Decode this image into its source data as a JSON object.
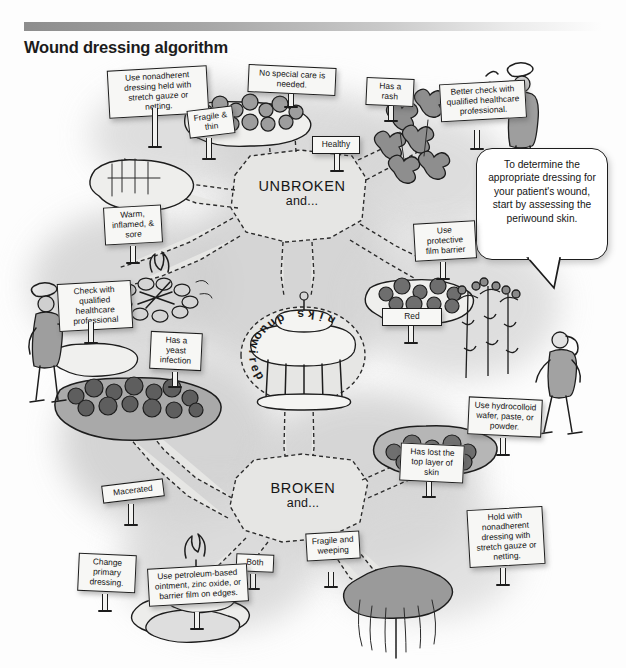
{
  "header": {
    "title": "Wound dressing algorithm"
  },
  "speech_bubble": {
    "text": "To determine the appropriate dressing for your patient's wound, start by assessing the periwound skin."
  },
  "center_hub": {
    "label": "periwound skin"
  },
  "branches": [
    {
      "id": "unbroken",
      "label": "UNBROKEN",
      "sublabel": "and..."
    },
    {
      "id": "broken",
      "label": "BROKEN",
      "sublabel": "and..."
    }
  ],
  "signs": [
    {
      "id": "use-nonadherent-dressing-held",
      "text": "Use nonadherent dressing held with stretch gauze or netting.",
      "kind": "action"
    },
    {
      "id": "fragile-and-thin",
      "text": "Fragile & thin",
      "kind": "condition"
    },
    {
      "id": "no-special-care",
      "text": "No special care is needed.",
      "kind": "action"
    },
    {
      "id": "healthy",
      "text": "Healthy",
      "kind": "condition"
    },
    {
      "id": "has-a-rash",
      "text": "Has a rash",
      "kind": "condition"
    },
    {
      "id": "better-check-with-qualified",
      "text": "Better check with qualified healthcare professional.",
      "kind": "action"
    },
    {
      "id": "warm-inflamed-and-sore",
      "text": "Warm, inflamed, & sore",
      "kind": "condition"
    },
    {
      "id": "check-with-qualified",
      "text": "Check with qualified healthcare professional",
      "kind": "action"
    },
    {
      "id": "has-a-yeast-infection",
      "text": "Has a yeast infection",
      "kind": "condition"
    },
    {
      "id": "use-protective-film-barrier",
      "text": "Use protective film barrier",
      "kind": "action"
    },
    {
      "id": "red",
      "text": "Red",
      "kind": "condition"
    },
    {
      "id": "use-hydrocolloid-wafer",
      "text": "Use hydrocolloid wafer, paste, or powder.",
      "kind": "action"
    },
    {
      "id": "has-lost-the-top-layer-of-skin",
      "text": "Has lost the top layer of skin",
      "kind": "condition"
    },
    {
      "id": "hold-with-nonadherent-dressing",
      "text": "Hold with nonadherent dressing with stretch gauze or netting.",
      "kind": "action"
    },
    {
      "id": "fragile-and-weeping",
      "text": "Fragile and weeping",
      "kind": "condition"
    },
    {
      "id": "both",
      "text": "Both",
      "kind": "condition"
    },
    {
      "id": "macerated",
      "text": "Macerated",
      "kind": "condition"
    },
    {
      "id": "change-primary-dressing",
      "text": "Change primary dressing.",
      "kind": "action"
    },
    {
      "id": "use-petroleum-based-ointment",
      "text": "Use petroleum-based ointment, zinc oxide, or barrier film on edges.",
      "kind": "action"
    }
  ],
  "colors": {
    "ink": "#1d1d1d",
    "paper": "#f7f7f5",
    "header_gradient_start": "#8d8d8d",
    "header_gradient_end": "#fdfdfd",
    "ground": "#c4c4c4"
  }
}
